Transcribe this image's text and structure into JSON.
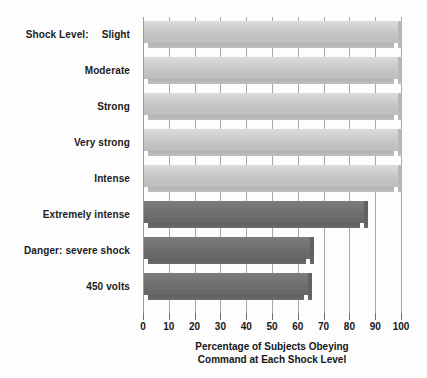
{
  "chart_data": {
    "type": "bar",
    "orientation": "horizontal",
    "title": "",
    "xlabel_line1": "Percentage of Subjects Obeying",
    "xlabel_line2": "Command at Each Shock Level",
    "ylabel": "Shock Level:",
    "category_prefix": "Shock Level:",
    "categories": [
      "Slight",
      "Moderate",
      "Strong",
      "Very strong",
      "Intense",
      "Extremely intense",
      "Danger: severe shock",
      "450 volts"
    ],
    "values": [
      100,
      100,
      100,
      100,
      100,
      87,
      66,
      65
    ],
    "xlim": [
      0,
      100
    ],
    "xticks": [
      0,
      10,
      20,
      30,
      40,
      50,
      60,
      70,
      80,
      90,
      100
    ],
    "xtick_labels": [
      "0",
      "10",
      "20",
      "30",
      "40",
      "50",
      "60",
      "70",
      "80",
      "90",
      "100"
    ],
    "grid": true,
    "legend": false,
    "bar_shades": [
      "light",
      "light",
      "light",
      "light",
      "light",
      "dark",
      "dark",
      "dark"
    ],
    "colors": {
      "bar_light": "#c6c6c6",
      "bar_light_edge": "#b2b2b2",
      "bar_dark": "#6e6e6e",
      "bar_dark_edge": "#5e5e5e",
      "gridline": "#a9a9a9",
      "axis": "#9a9a9a",
      "text": "#161616",
      "background": "#fdfdfd"
    }
  }
}
